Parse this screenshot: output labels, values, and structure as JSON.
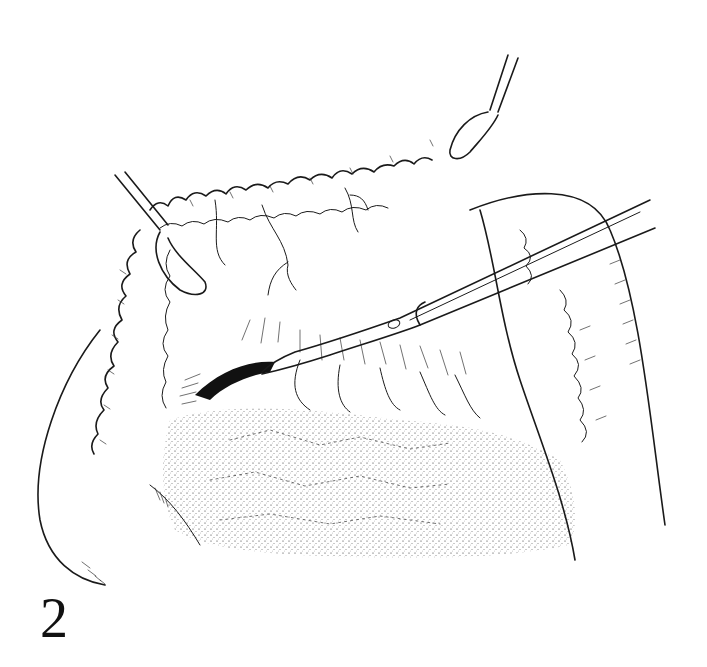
{
  "figure": {
    "number": "2",
    "colors": {
      "ink": "#1a1a1a",
      "background": "#ffffff"
    }
  }
}
